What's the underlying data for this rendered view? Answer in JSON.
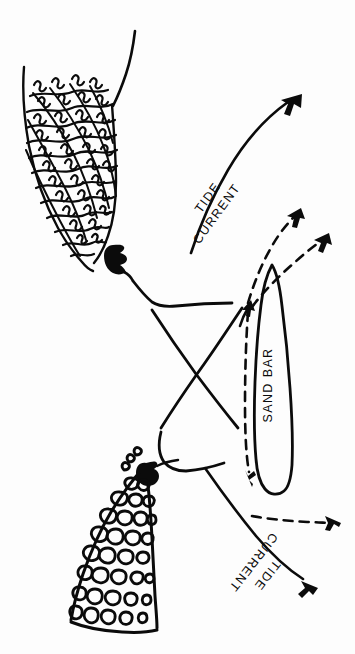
{
  "figure": {
    "background_color": "#fdfdfd",
    "ink_color": "#0b0b0b",
    "width": 355,
    "height": 654
  },
  "labels": {
    "tide_current_upper_line1": "TIDE",
    "tide_current_upper_line2": "CURRENT",
    "tide_current_lower_line1": "TIDE",
    "tide_current_lower_line2": "CURRENT",
    "sand_bar": "SAND BAR"
  },
  "features": {
    "marsh_landmass": "marsh-grass-landmass",
    "cobble_landmass": "cobble-shingle-landmass",
    "upper_jetty": "upper-rocky-point",
    "lower_jetty": "lower-rocky-point",
    "sand_bar_shape": "sand-bar-outline",
    "inlet_channel_lines": "crossing-channel-lines",
    "shoreline": "upper-shoreline-curve"
  },
  "arrows": {
    "solid_upper": "tide-current-arrow-upper",
    "solid_lower": "tide-current-arrow-lower",
    "dashed_inner": "dashed-flow-arrow-inner",
    "dashed_outer": "dashed-flow-arrow-outer",
    "dashed_down": "dashed-flow-arrow-down",
    "dashed_right": "dashed-flow-arrow-right",
    "solid_small_up": "small-flow-arrow-up"
  }
}
